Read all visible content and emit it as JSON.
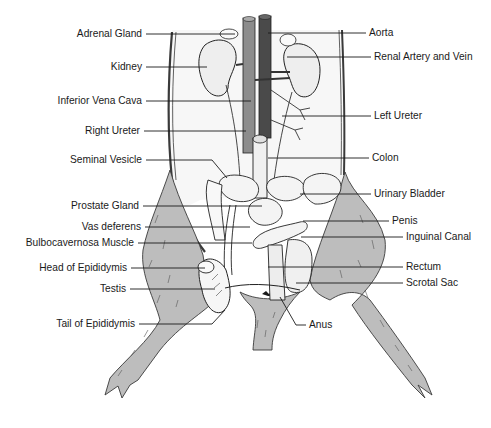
{
  "diagram": {
    "colors": {
      "background": "#ffffff",
      "fur": "#bdbdbd",
      "fur_stroke": "#3a3a3a",
      "cavity": "#f7f7f7",
      "aorta": "#4a4a4a",
      "vena_cava": "#8c8c8c",
      "organ": "#f2f2f2",
      "ink": "#1a1a1a"
    },
    "labels_left": [
      {
        "id": "adrenal-gland",
        "text": "Adrenal Gland",
        "x": 144,
        "y": 34,
        "tx": 235,
        "ty": 34
      },
      {
        "id": "kidney",
        "text": "Kidney",
        "x": 144,
        "y": 67,
        "tx": 207,
        "ty": 67
      },
      {
        "id": "inferior-vena-cava",
        "text": "Inferior Vena Cava",
        "x": 144,
        "y": 101,
        "tx": 251,
        "ty": 101
      },
      {
        "id": "right-ureter",
        "text": "Right Ureter",
        "x": 142,
        "y": 131,
        "tx": 246,
        "ty": 131
      },
      {
        "id": "seminal-vesicle",
        "text": "Seminal Vesicle",
        "x": 144,
        "y": 160,
        "tx": 227,
        "ty": 178
      },
      {
        "id": "prostate-gland",
        "text": "Prostate Gland",
        "x": 141,
        "y": 206,
        "tx": 262,
        "ty": 206
      },
      {
        "id": "vas-deferens",
        "text": "Vas deferens",
        "x": 143,
        "y": 227,
        "tx": 250,
        "ty": 227
      },
      {
        "id": "bulbocavernosa-muscle",
        "text": "Bulbocavernosa Muscle",
        "x": 136,
        "y": 243,
        "tx": 252,
        "ty": 243
      },
      {
        "id": "head-of-epididymis",
        "text": "Head of Epididymis",
        "x": 129,
        "y": 268,
        "tx": 205,
        "ty": 268
      },
      {
        "id": "testis",
        "text": "Testis",
        "x": 128,
        "y": 289,
        "tx": 215,
        "ty": 289
      },
      {
        "id": "tail-of-epididymis",
        "text": "Tail of Epididymis",
        "x": 137,
        "y": 324,
        "tx": 225,
        "ty": 310
      }
    ],
    "labels_right": [
      {
        "id": "aorta",
        "text": "Aorta",
        "x": 368,
        "y": 33,
        "tx": 268,
        "ty": 33
      },
      {
        "id": "renal-artery-and-vein",
        "text": "Renal Artery and Vein",
        "x": 373,
        "y": 57,
        "tx": 287,
        "ty": 57
      },
      {
        "id": "left-ureter",
        "text": "Left Ureter",
        "x": 373,
        "y": 116,
        "tx": 282,
        "ty": 116
      },
      {
        "id": "colon",
        "text": "Colon",
        "x": 371,
        "y": 158,
        "tx": 268,
        "ty": 158
      },
      {
        "id": "urinary-bladder",
        "text": "Urinary Bladder",
        "x": 373,
        "y": 194,
        "tx": 300,
        "ty": 194
      },
      {
        "id": "penis",
        "text": "Penis",
        "x": 391,
        "y": 221,
        "tx": 303,
        "ty": 221
      },
      {
        "id": "inguinal-canal",
        "text": "Inguinal Canal",
        "x": 405,
        "y": 237,
        "tx": 301,
        "ty": 237
      },
      {
        "id": "rectum",
        "text": "Rectum",
        "x": 405,
        "y": 267,
        "tx": 268,
        "ty": 267
      },
      {
        "id": "scrotal-sac",
        "text": "Scrotal Sac",
        "x": 405,
        "y": 283,
        "tx": 296,
        "ty": 283
      },
      {
        "id": "anus",
        "text": "Anus",
        "x": 308,
        "y": 325,
        "tx": 280,
        "ty": 297
      }
    ]
  }
}
